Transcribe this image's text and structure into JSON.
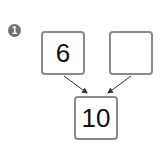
{
  "problem": {
    "number": "1",
    "top_left_value": "6",
    "top_right_value": "",
    "bottom_value": "10"
  },
  "colors": {
    "badge": "#707070",
    "box_border": "#8a8a8a",
    "arrow": "#333333"
  }
}
